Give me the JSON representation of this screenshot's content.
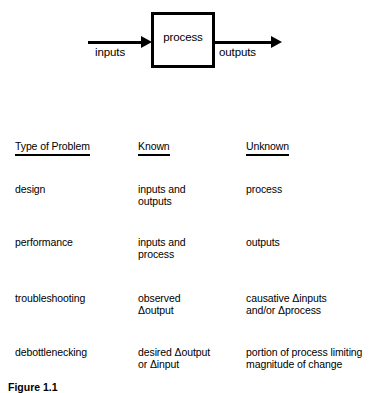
{
  "diagram": {
    "box_label": "process",
    "input_label": "inputs",
    "output_label": "outputs",
    "input_arrow_icon": "arrow-right-icon",
    "output_arrow_icon": "arrow-right-icon"
  },
  "table": {
    "headers": {
      "col1": "Type of Problem",
      "col2": "Known",
      "col3": "Unknown"
    },
    "rows": [
      {
        "type": "design",
        "known": "inputs and\noutputs",
        "unknown": "process"
      },
      {
        "type": "performance",
        "known": "inputs and\nprocess",
        "unknown": "outputs"
      },
      {
        "type": "troubleshooting",
        "known": "observed\nΔoutput",
        "unknown": "causative Δinputs\nand/or Δprocess"
      },
      {
        "type": "debottlenecking",
        "known": "desired Δoutput\nor Δinput",
        "unknown": "portion of process limiting\nmagnitude of change"
      }
    ]
  },
  "caption": {
    "text": "Figure 1.1"
  },
  "colors": {
    "ink": "#000000",
    "background": "#ffffff"
  }
}
